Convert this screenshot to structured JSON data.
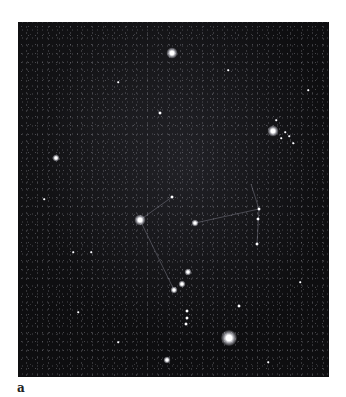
{
  "figure": {
    "panel_label": "a",
    "background_color": "#0e0e10",
    "page_color": "#ffffff"
  },
  "stars": [
    {
      "name": "meissa-star",
      "x": 154,
      "y": 31,
      "size": "s-l"
    },
    {
      "name": "betelgeuse-star",
      "x": 255,
      "y": 109,
      "size": "s-l"
    },
    {
      "name": "left-field-star",
      "x": 38,
      "y": 136,
      "size": "s-m"
    },
    {
      "name": "upper-mid-star",
      "x": 142,
      "y": 91,
      "size": "s-s"
    },
    {
      "name": "bellatrix-star",
      "x": 122,
      "y": 198,
      "size": "s-l"
    },
    {
      "name": "belt-mid-star",
      "x": 177,
      "y": 201,
      "size": "s-m"
    },
    {
      "name": "upper-belt-star",
      "x": 154,
      "y": 175,
      "size": "s-s"
    },
    {
      "name": "right-arm-star-1",
      "x": 241,
      "y": 187,
      "size": "s-s"
    },
    {
      "name": "right-arm-star-2",
      "x": 240,
      "y": 197,
      "size": "s-s"
    },
    {
      "name": "right-arm-star-3",
      "x": 239,
      "y": 222,
      "size": "s-s"
    },
    {
      "name": "nebula-star-1",
      "x": 170,
      "y": 250,
      "size": "s-m"
    },
    {
      "name": "nebula-star-2",
      "x": 164,
      "y": 262,
      "size": "s-m"
    },
    {
      "name": "nebula-star-3",
      "x": 156,
      "y": 268,
      "size": "s-m"
    },
    {
      "name": "sword-star-1",
      "x": 169,
      "y": 289,
      "size": "s-s"
    },
    {
      "name": "sword-star-2",
      "x": 169,
      "y": 296,
      "size": "s-s"
    },
    {
      "name": "sword-star-3",
      "x": 168,
      "y": 302,
      "size": "s-s"
    },
    {
      "name": "rigel-star",
      "x": 211,
      "y": 316,
      "size": "s-xl"
    },
    {
      "name": "lower-right-star",
      "x": 221,
      "y": 284,
      "size": "s-s"
    },
    {
      "name": "saiph-star",
      "x": 149,
      "y": 338,
      "size": "s-m"
    },
    {
      "name": "cluster-star-1",
      "x": 267,
      "y": 110,
      "size": "s-xs"
    },
    {
      "name": "cluster-star-2",
      "x": 271,
      "y": 114,
      "size": "s-xs"
    },
    {
      "name": "cluster-star-3",
      "x": 263,
      "y": 116,
      "size": "s-xs"
    },
    {
      "name": "cluster-star-4",
      "x": 275,
      "y": 121,
      "size": "s-xs"
    },
    {
      "name": "cluster-star-5",
      "x": 258,
      "y": 98,
      "size": "s-xs"
    },
    {
      "name": "left-low-star",
      "x": 26,
      "y": 177,
      "size": "s-xs"
    },
    {
      "name": "left-mid-star",
      "x": 55,
      "y": 230,
      "size": "s-xs"
    },
    {
      "name": "center-star",
      "x": 73,
      "y": 230,
      "size": "s-xs"
    },
    {
      "name": "field-star-a",
      "x": 210,
      "y": 48,
      "size": "s-xs"
    },
    {
      "name": "field-star-b",
      "x": 290,
      "y": 68,
      "size": "s-xs"
    },
    {
      "name": "field-star-c",
      "x": 100,
      "y": 60,
      "size": "s-xs"
    },
    {
      "name": "field-star-d",
      "x": 60,
      "y": 290,
      "size": "s-xs"
    },
    {
      "name": "field-star-e",
      "x": 282,
      "y": 260,
      "size": "s-xs"
    },
    {
      "name": "field-star-f",
      "x": 250,
      "y": 340,
      "size": "s-xs"
    },
    {
      "name": "field-star-g",
      "x": 100,
      "y": 320,
      "size": "s-xs"
    }
  ],
  "constellation_lines": [
    {
      "x1": 177,
      "y1": 201,
      "x2": 241,
      "y2": 187
    },
    {
      "x1": 241,
      "y1": 187,
      "x2": 239,
      "y2": 222
    },
    {
      "x1": 233,
      "y1": 162,
      "x2": 241,
      "y2": 187
    },
    {
      "x1": 122,
      "y1": 198,
      "x2": 154,
      "y2": 175
    },
    {
      "x1": 122,
      "y1": 198,
      "x2": 156,
      "y2": 268
    }
  ]
}
